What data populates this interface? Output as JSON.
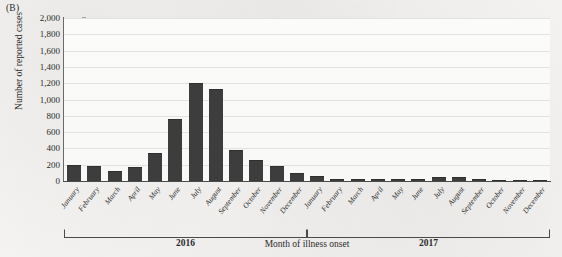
{
  "figure": {
    "panel_label": "(B)",
    "ylabel": "Number of reported cases",
    "xlabel": "Month of illness onset"
  },
  "year_groups": [
    {
      "label": "2016",
      "start_index": 0,
      "end_index": 11
    },
    {
      "label": "2017",
      "start_index": 12,
      "end_index": 23
    }
  ],
  "colors": {
    "bar": "#3d3d3d",
    "axis": "#4a4a4a",
    "gridline": "#e3e2e0",
    "plot_background": "#fbfbfa",
    "page_background": "#f2f1ef",
    "text": "#2b2b2b"
  },
  "chart_data": {
    "type": "bar",
    "title": "",
    "xlabel": "Month of illness onset",
    "ylabel": "Number of reported cases",
    "ylim": [
      0,
      2000
    ],
    "ytick_labels": [
      "2,000",
      "1,800",
      "1,600",
      "1,400",
      "1,200",
      "1,000",
      "800",
      "600",
      "400",
      "200",
      "0"
    ],
    "ytick_values": [
      2000,
      1800,
      1600,
      1400,
      1200,
      1000,
      800,
      600,
      400,
      200,
      0
    ],
    "grid": true,
    "legend": "none",
    "categories": [
      "January",
      "February",
      "March",
      "April",
      "May",
      "June",
      "July",
      "August",
      "September",
      "October",
      "November",
      "December",
      "January",
      "February",
      "March",
      "April",
      "May",
      "June",
      "July",
      "August",
      "September",
      "October",
      "November",
      "December"
    ],
    "values": [
      195,
      185,
      120,
      175,
      345,
      755,
      1200,
      1130,
      380,
      260,
      180,
      95,
      60,
      25,
      25,
      25,
      25,
      25,
      45,
      45,
      20,
      8,
      5,
      5
    ]
  }
}
